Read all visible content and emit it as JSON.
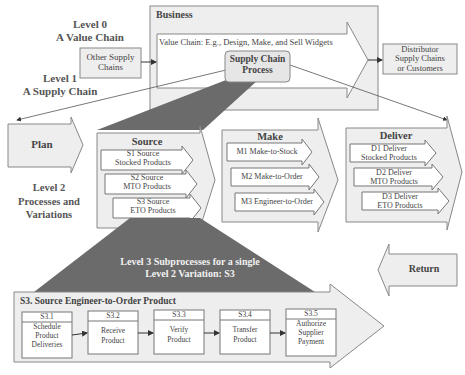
{
  "level_labels": {
    "level0": [
      "Level 0",
      "A Value Chain"
    ],
    "level1": [
      "Level 1",
      "A Supply Chain"
    ],
    "level2": [
      "Level 2",
      "Processes and",
      "Variations"
    ]
  },
  "level0": {
    "other_supply_chains": [
      "Other Supply",
      "Chains"
    ],
    "business_title": "Business",
    "value_chain": "Value Chain: E.g., Design, Make, and Sell Widgets",
    "supply_chain_process": [
      "Supply Chain",
      "Process"
    ],
    "distributor": [
      "Distributor",
      "Supply Chains",
      "or Customers"
    ]
  },
  "level2": {
    "plan": "Plan",
    "source": {
      "title": "Source",
      "variations": [
        [
          "S1 Source",
          "Stocked Products"
        ],
        [
          "S2 Source",
          "MTO Products"
        ],
        [
          "S3 Source",
          "ETO Products"
        ]
      ]
    },
    "make": {
      "title": "Make",
      "variations": [
        "M1 Make-to-Stock",
        "M2 Make-to-Order",
        "M3 Engineer-to-Order"
      ]
    },
    "deliver": {
      "title": "Deliver",
      "variations": [
        [
          "D1 Deliver",
          "Stocked Products"
        ],
        [
          "D2 Deliver",
          "MTO Products"
        ],
        [
          "D3 Deliver",
          "ETO Products"
        ]
      ]
    },
    "return": "Return"
  },
  "level3": {
    "funnel_label": [
      "Level 3 Subprocesses for a single",
      "Level 2 Variation: S3"
    ],
    "title": "S3. Source Engineer-to-Order Product",
    "steps": [
      {
        "id": "S3.1",
        "label": [
          "Schedule",
          "Product",
          "Deliveries"
        ]
      },
      {
        "id": "S3.2",
        "label": [
          "Receive",
          "Product"
        ]
      },
      {
        "id": "S3.3",
        "label": [
          "Verify",
          "Product"
        ]
      },
      {
        "id": "S3.4",
        "label": [
          "Transfer",
          "Product"
        ]
      },
      {
        "id": "S3.5",
        "label": [
          "Authorize",
          "Supplier",
          "Payment"
        ]
      }
    ]
  },
  "colors": {
    "box_fill": "#eeeeee",
    "stroke": "#777777",
    "funnel": "#6b6b6b",
    "text": "#444444"
  }
}
